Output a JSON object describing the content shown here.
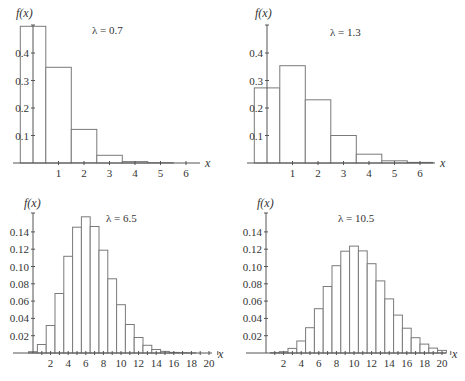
{
  "chart_data": [
    {
      "type": "bar",
      "title": "λ = 0.7",
      "xlabel": "x",
      "ylabel": "f(x)",
      "x": [
        0,
        1,
        2,
        3,
        4,
        5,
        6
      ],
      "values": [
        0.497,
        0.348,
        0.122,
        0.028,
        0.005,
        0.001,
        0.0001
      ],
      "xticks": [
        1,
        2,
        3,
        4,
        5,
        6
      ],
      "yticks": [
        0.1,
        0.2,
        0.3,
        0.4
      ],
      "ytick_labels": [
        "0.1",
        "0.2",
        "0.3",
        "0.4"
      ],
      "xlim": [
        -0.5,
        6.6
      ],
      "ylim": [
        0,
        0.5
      ],
      "grid": false,
      "legend": "none"
    },
    {
      "type": "bar",
      "title": "λ = 1.3",
      "xlabel": "x",
      "ylabel": "f(x)",
      "x": [
        0,
        1,
        2,
        3,
        4,
        5,
        6
      ],
      "values": [
        0.273,
        0.354,
        0.23,
        0.1,
        0.032,
        0.008,
        0.002
      ],
      "xticks": [
        1,
        2,
        3,
        4,
        5,
        6
      ],
      "yticks": [
        0.1,
        0.2,
        0.3,
        0.4
      ],
      "ytick_labels": [
        "0.1",
        "0.2",
        "0.3",
        "0.4"
      ],
      "xlim": [
        -0.5,
        6.6
      ],
      "ylim": [
        0,
        0.5
      ],
      "grid": false,
      "legend": "none"
    },
    {
      "type": "bar",
      "title": "λ = 6.5",
      "xlabel": "x",
      "ylabel": "f(x)",
      "x": [
        0,
        1,
        2,
        3,
        4,
        5,
        6,
        7,
        8,
        9,
        10,
        11,
        12,
        13,
        14,
        15,
        16,
        17,
        18,
        19,
        20
      ],
      "values": [
        0.0015,
        0.0098,
        0.0318,
        0.0688,
        0.1118,
        0.1454,
        0.1575,
        0.1462,
        0.1188,
        0.0858,
        0.0558,
        0.033,
        0.0179,
        0.0089,
        0.0041,
        0.0018,
        0.0007,
        0.0003,
        0.0001,
        0.0,
        0.0
      ],
      "xticks": [
        2,
        4,
        6,
        8,
        10,
        12,
        14,
        16,
        18,
        20
      ],
      "yticks": [
        0.02,
        0.04,
        0.06,
        0.08,
        0.1,
        0.12,
        0.14
      ],
      "ytick_labels": [
        "0.02",
        "0.04",
        "0.06",
        "0.08",
        "0.10",
        "0.12",
        "0.14"
      ],
      "xlim": [
        -0.5,
        21
      ],
      "ylim": [
        0,
        0.16
      ],
      "grid": false,
      "legend": "none"
    },
    {
      "type": "bar",
      "title": "λ = 10.5",
      "xlabel": "x",
      "ylabel": "f(x)",
      "x": [
        0,
        1,
        2,
        3,
        4,
        5,
        6,
        7,
        8,
        9,
        10,
        11,
        12,
        13,
        14,
        15,
        16,
        17,
        18,
        19,
        20
      ],
      "values": [
        0.0,
        0.0003,
        0.0015,
        0.0053,
        0.0139,
        0.0293,
        0.0512,
        0.0769,
        0.1009,
        0.1177,
        0.1236,
        0.118,
        0.1032,
        0.0834,
        0.0625,
        0.0438,
        0.0287,
        0.0177,
        0.0103,
        0.0057,
        0.003
      ],
      "xticks": [
        2,
        4,
        6,
        8,
        10,
        12,
        14,
        16,
        18,
        20
      ],
      "yticks": [
        0.02,
        0.04,
        0.06,
        0.08,
        0.1,
        0.12,
        0.14
      ],
      "ytick_labels": [
        "0.02",
        "0.04",
        "0.06",
        "0.08",
        "0.10",
        "0.12",
        "0.14"
      ],
      "xlim": [
        -0.5,
        21
      ],
      "ylim": [
        0,
        0.16
      ],
      "grid": false,
      "legend": "none"
    }
  ],
  "panels": [
    {
      "ylabel": "f(x)",
      "lambda_label": "λ = 0.7",
      "xlabel": "x"
    },
    {
      "ylabel": "f(x)",
      "lambda_label": "λ = 1.3",
      "xlabel": "x"
    },
    {
      "ylabel": "f(x)",
      "lambda_label": "λ = 6.5",
      "xlabel": "x"
    },
    {
      "ylabel": "f(x)",
      "lambda_label": "λ = 10.5",
      "xlabel": "x"
    }
  ]
}
